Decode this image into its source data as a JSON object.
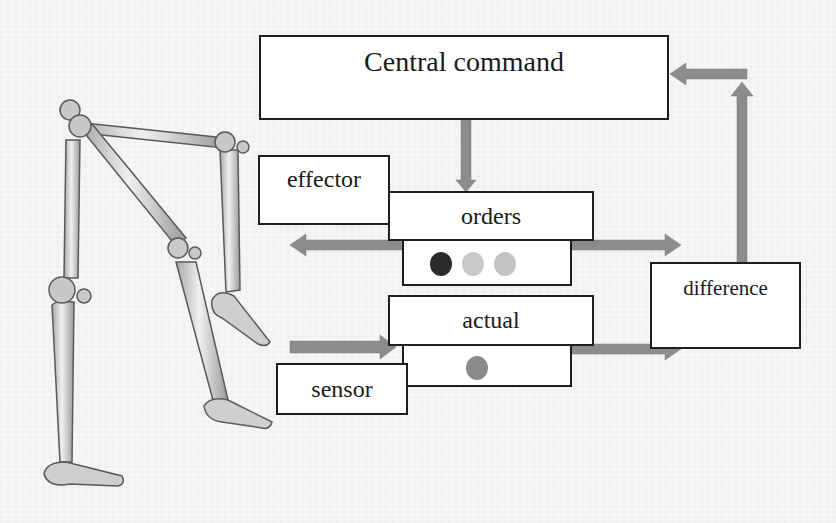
{
  "diagram": {
    "nodes": {
      "central_command": "Central command",
      "effector": "effector",
      "orders": "orders",
      "actual": "actual",
      "sensor": "sensor",
      "difference": "difference"
    },
    "indicators": {
      "orders": [
        {
          "state": "active",
          "color": "#2a2a2a"
        },
        {
          "state": "inactive",
          "color": "#c9c9c9"
        },
        {
          "state": "inactive",
          "color": "#c4c4c4"
        }
      ],
      "actual": [
        {
          "state": "active",
          "color": "#8a8a8a"
        }
      ]
    },
    "edges": [
      {
        "from": "Central command",
        "to": "orders"
      },
      {
        "from": "orders",
        "to": "effector"
      },
      {
        "from": "orders",
        "to": "difference"
      },
      {
        "from": "sensor",
        "to": "actual"
      },
      {
        "from": "actual",
        "to": "difference"
      },
      {
        "from": "difference",
        "to": "Central command"
      }
    ],
    "illustration": "skeletal legs (bones of both lower limbs, mid-stride)",
    "colors": {
      "arrow": "#8c8c8c",
      "box_border": "#1e1e1e",
      "box_fill": "#ffffff",
      "bone": "#d9d9d9",
      "bone_outline": "#5a5a5a"
    }
  }
}
